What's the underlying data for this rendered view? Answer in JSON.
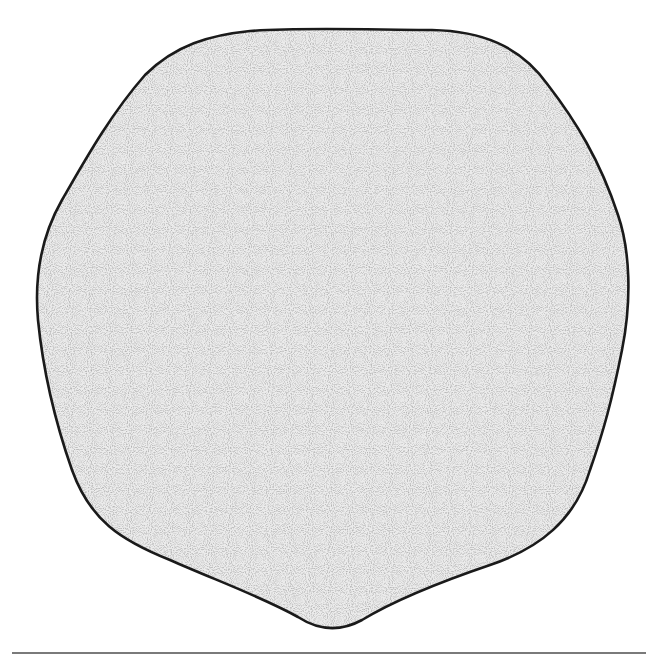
{
  "figure": {
    "outline_color": "#1a1a1a",
    "fill_base_color": "#ececec",
    "stipple_color": "#6e6e6e",
    "lobes": 6
  },
  "rule": {
    "color": "#7a7a7a"
  }
}
